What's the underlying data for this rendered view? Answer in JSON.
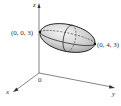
{
  "figure": {
    "type": "3d-ellipsoid-diagram",
    "axes": {
      "x_label": "x",
      "y_label": "y",
      "z_label": "z",
      "origin_label": "0"
    },
    "points": [
      {
        "label": "(0, 0, 3)"
      },
      {
        "label": "(0, 4, 3)"
      }
    ],
    "colors": {
      "axis": "#555555",
      "ellipsoid_fill": "#cfcfcf",
      "ellipsoid_highlight": "#f2f2f2",
      "outline": "#222222"
    }
  }
}
